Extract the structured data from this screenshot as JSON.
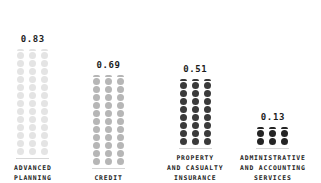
{
  "chart_data": {
    "type": "bar",
    "subtype": "pictorial-dot-column",
    "title": "",
    "xlabel": "",
    "ylabel": "",
    "grid": false,
    "legend": false,
    "ylim": [
      0,
      0.83
    ],
    "categories": [
      "ADVANCED\nPLANNING",
      "CREDIT",
      "PROPERTY\nAND CASUALTY\nINSURANCE",
      "ADMINISTRATIVE\nAND ACCOUNTING\nSERVICES"
    ],
    "values": [
      0.83,
      0.69,
      0.51,
      0.13
    ],
    "value_labels": [
      "0.83",
      "0.69",
      "0.51",
      "0.13"
    ],
    "colors": [
      "#e4e4e4",
      "#b6b6b6",
      "#3a3a3a",
      "#242424"
    ],
    "dot_columns_per_group": 3,
    "dot_rows": [
      14,
      12,
      9,
      3
    ],
    "dot_top_row_clipped": [
      true,
      true,
      true,
      true
    ],
    "baseline_color": "#d6d6d6",
    "background": "#ffffff",
    "text_color": "#1c1c1c"
  },
  "groups": [
    {
      "name": "advanced-planning",
      "value_label": "0.83",
      "category_label": "ADVANCED\nPLANNING",
      "color": "#e4e4e4",
      "rows": 14,
      "left": 14,
      "bottom": 0
    },
    {
      "name": "credit",
      "value_label": "0.69",
      "category_label": "CREDIT",
      "color": "#b6b6b6",
      "rows": 12,
      "left": 92,
      "bottom": 0
    },
    {
      "name": "property-and-casualty-insurance",
      "value_label": "0.51",
      "category_label": "PROPERTY\nAND CASUALTY\nINSURANCE",
      "color": "#3a3a3a",
      "rows": 9,
      "left": 167,
      "bottom": 0
    },
    {
      "name": "administrative-and-accounting-services",
      "value_label": "0.13",
      "category_label": "ADMINISTRATIVE\nAND ACCOUNTING\nSERVICES",
      "color": "#242424",
      "rows": 3,
      "left": 240,
      "bottom": 0
    }
  ]
}
